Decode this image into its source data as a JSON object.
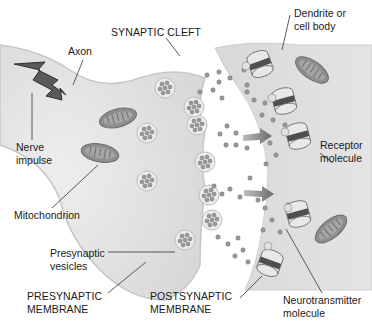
{
  "diagram": {
    "labels": {
      "synaptic_cleft": "SYNAPTIC CLEFT",
      "axon": "Axon",
      "dendrite": "Dendrite or\ncell body",
      "nerve_impulse": "Nerve\nimpulse",
      "receptor": "Receptor\nmolecule",
      "mitochondrion": "Mitochondrion",
      "presynaptic_vesicles": "Presynaptic\nvesicles",
      "presynaptic_membrane": "PRESYNAPTIC\nMEMBRANE",
      "postsynaptic_membrane": "POSTSYNAPTIC\nMEMBRANE",
      "neurotransmitter": "Neurotransmitter\nmolecule"
    },
    "colors": {
      "cell_fill": "#e2e2e2",
      "cell_edge": "#c8c8c8",
      "mito_outer": "#8a8a8a",
      "mito_inner": "#6e6e6e",
      "receptor_band": "#555555",
      "vesicle_fill": "#ececec",
      "molecule": "#8c8c8c",
      "arrow": "#7a7a7a",
      "impulse": "#3a3a3a",
      "text": "#1a1a1a"
    }
  }
}
